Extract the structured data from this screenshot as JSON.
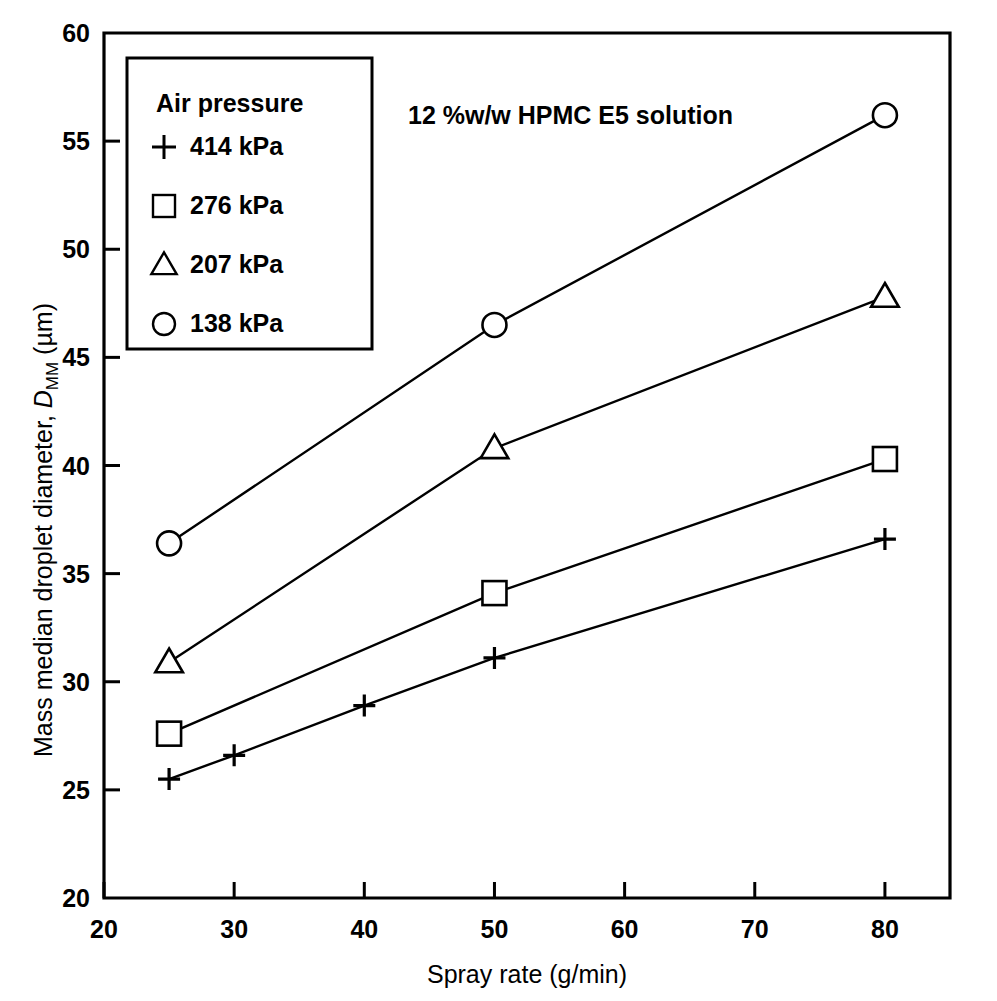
{
  "chart_data": {
    "type": "line",
    "title": "",
    "annotation": "12 %w/w HPMC E5 solution",
    "xlabel": "Spray rate (g/min)",
    "ylabel_plain": "Mass median droplet diameter, D_MM (µm)",
    "ylabel_parts": {
      "lead": "Mass median droplet diameter, ",
      "symbol": "D",
      "subscript": "MM",
      "units": " (µm)"
    },
    "xlim": [
      20,
      85
    ],
    "ylim": [
      20,
      60
    ],
    "xticks": [
      20,
      30,
      40,
      50,
      60,
      70,
      80
    ],
    "yticks": [
      20,
      25,
      30,
      35,
      40,
      45,
      50,
      55,
      60
    ],
    "xtick_labels": [
      "20",
      "30",
      "40",
      "50",
      "60",
      "70",
      "80"
    ],
    "ytick_labels": [
      "20",
      "25",
      "30",
      "35",
      "40",
      "45",
      "50",
      "55",
      "60"
    ],
    "grid": false,
    "legend_position": "upper-left-inset",
    "legend_title": "Air pressure",
    "series": [
      {
        "name": "414 kPa",
        "marker": "plus",
        "x": [
          25,
          30,
          40,
          50,
          80
        ],
        "values": [
          25.5,
          26.6,
          28.9,
          31.1,
          36.6
        ]
      },
      {
        "name": "276 kPa",
        "marker": "square",
        "x": [
          25,
          50,
          80
        ],
        "values": [
          27.6,
          34.1,
          40.3
        ]
      },
      {
        "name": "207 kPa",
        "marker": "triangle",
        "x": [
          25,
          50,
          80
        ],
        "values": [
          30.9,
          40.8,
          47.8
        ]
      },
      {
        "name": "138 kPa",
        "marker": "circle",
        "x": [
          25,
          50,
          80
        ],
        "values": [
          36.4,
          46.5,
          56.2
        ]
      }
    ],
    "colors": {
      "ink": "#000000",
      "background": "#ffffff"
    }
  }
}
